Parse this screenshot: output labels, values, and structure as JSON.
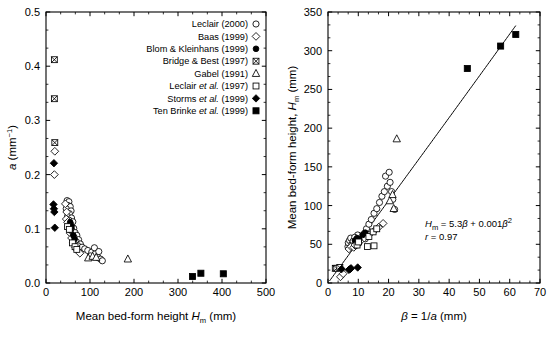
{
  "figure": {
    "background": "#ffffff",
    "ink": "#000000"
  },
  "legend": {
    "name": "data-source-legend",
    "entries": [
      {
        "label": "Leclair (2000)",
        "marker": "open-circle"
      },
      {
        "label": "Baas (1999)",
        "marker": "open-diamond"
      },
      {
        "label": "Blom & Kleinhans (1999)",
        "marker": "filled-circle"
      },
      {
        "label": "Bridge & Best (1997)",
        "marker": "crossed-square"
      },
      {
        "label": "Gabel (1991)",
        "marker": "open-triangle"
      },
      {
        "label": "Leclair et al. (1997)",
        "marker": "open-square"
      },
      {
        "label": "Storms et al. (1999)",
        "marker": "filled-diamond"
      },
      {
        "label": "Ten Brinke et al. (1999)",
        "marker": "filled-square"
      }
    ]
  },
  "chart_data": [
    {
      "id": "left-panel",
      "type": "scatter",
      "title": "",
      "xlabel": "Mean bed-form height Hₘ (mm)",
      "xlabel_parts": {
        "pre": "Mean bed-form height ",
        "sym": "H",
        "sub": "m",
        "post": " (mm)"
      },
      "ylabel": "a (mm⁻¹)",
      "ylabel_parts": {
        "sym": "a",
        "post": " (mm",
        "sup": "−1",
        "tail": ")"
      },
      "xlim": [
        0,
        500
      ],
      "ylim": [
        0.0,
        0.5
      ],
      "xticks": [
        0,
        100,
        200,
        300,
        400,
        500
      ],
      "xticklabels": [
        "0",
        "100",
        "200",
        "300",
        "400",
        "500"
      ],
      "yticks": [
        0.0,
        0.1,
        0.2,
        0.3,
        0.4,
        0.5
      ],
      "yticklabels": [
        "0.0",
        "0.1",
        "0.2",
        "0.3",
        "0.4",
        "0.5"
      ],
      "x_minor_count": 2,
      "y_minor_count": 2,
      "grid": false,
      "legend_position": "top-right-inside",
      "series": [
        {
          "name": "Leclair (2000)",
          "marker": "open-circle",
          "points": [
            [
              48,
              0.152
            ],
            [
              52,
              0.15
            ],
            [
              50,
              0.143
            ],
            [
              55,
              0.141
            ],
            [
              46,
              0.137
            ],
            [
              57,
              0.133
            ],
            [
              53,
              0.128
            ],
            [
              49,
              0.123
            ],
            [
              58,
              0.12
            ],
            [
              52,
              0.116
            ],
            [
              61,
              0.113
            ],
            [
              56,
              0.108
            ],
            [
              50,
              0.104
            ],
            [
              63,
              0.101
            ],
            [
              59,
              0.097
            ],
            [
              66,
              0.093
            ],
            [
              70,
              0.088
            ],
            [
              64,
              0.084
            ],
            [
              74,
              0.08
            ],
            [
              69,
              0.076
            ],
            [
              78,
              0.072
            ],
            [
              72,
              0.069
            ],
            [
              82,
              0.066
            ],
            [
              88,
              0.063
            ],
            [
              95,
              0.06
            ],
            [
              104,
              0.057
            ],
            [
              112,
              0.054
            ],
            [
              101,
              0.05
            ],
            [
              118,
              0.047
            ],
            [
              124,
              0.044
            ],
            [
              128,
              0.041
            ],
            [
              110,
              0.065
            ],
            [
              120,
              0.058
            ]
          ]
        },
        {
          "name": "Baas (1999)",
          "marker": "open-diamond",
          "points": [
            [
              20,
              0.243
            ],
            [
              19,
              0.2
            ],
            [
              44,
              0.146
            ],
            [
              47,
              0.131
            ],
            [
              46,
              0.118
            ],
            [
              49,
              0.112
            ],
            [
              52,
              0.1
            ],
            [
              55,
              0.092
            ],
            [
              58,
              0.083
            ],
            [
              62,
              0.074
            ],
            [
              67,
              0.066
            ],
            [
              72,
              0.06
            ],
            [
              77,
              0.055
            ]
          ]
        },
        {
          "name": "Blom & Kleinhans (1999)",
          "marker": "filled-circle",
          "points": [
            [
              55,
              0.112
            ],
            [
              58,
              0.104
            ],
            [
              56,
              0.097
            ],
            [
              62,
              0.088
            ],
            [
              65,
              0.081
            ]
          ]
        },
        {
          "name": "Bridge & Best (1997)",
          "marker": "crossed-square",
          "points": [
            [
              19,
              0.412
            ],
            [
              19,
              0.34
            ],
            [
              20,
              0.259
            ]
          ]
        },
        {
          "name": "Gabel (1991)",
          "marker": "open-triangle",
          "points": [
            [
              96,
              0.046
            ],
            [
              106,
              0.049
            ],
            [
              114,
              0.047
            ],
            [
              186,
              0.044
            ]
          ]
        },
        {
          "name": "Leclair et al. (1997)",
          "marker": "open-square",
          "points": [
            [
              49,
              0.104
            ],
            [
              53,
              0.099
            ],
            [
              60,
              0.074
            ],
            [
              66,
              0.067
            ],
            [
              70,
              0.062
            ]
          ]
        },
        {
          "name": "Storms et al. (1999)",
          "marker": "filled-diamond",
          "points": [
            [
              18,
              0.221
            ],
            [
              17,
              0.145
            ],
            [
              18,
              0.137
            ],
            [
              20,
              0.102
            ],
            [
              19,
              0.131
            ]
          ]
        },
        {
          "name": "Ten Brinke et al. (1999)",
          "marker": "filled-square",
          "points": [
            [
              333,
              0.012
            ],
            [
              352,
              0.018
            ],
            [
              403,
              0.017
            ]
          ]
        }
      ]
    },
    {
      "id": "right-panel",
      "type": "scatter",
      "title": "",
      "xlabel": "β = 1/a (mm)",
      "xlabel_parts": {
        "sym": "β",
        "mid": " = 1/",
        "sym2": "a",
        "post": " (mm)"
      },
      "ylabel": "Mean bed-form height, Hₘ (mm)",
      "ylabel_parts": {
        "pre": "Mean bed-form height, ",
        "sym": "H",
        "sub": "m",
        "post": " (mm)"
      },
      "xlim": [
        0,
        70
      ],
      "ylim": [
        0,
        350
      ],
      "xticks": [
        0,
        10,
        20,
        30,
        40,
        50,
        60,
        70
      ],
      "xticklabels": [
        "0",
        "10",
        "20",
        "30",
        "40",
        "50",
        "60",
        "70"
      ],
      "yticks": [
        0,
        50,
        100,
        150,
        200,
        250,
        300,
        350
      ],
      "yticklabels": [
        "0",
        "50",
        "100",
        "150",
        "200",
        "250",
        "300",
        "350"
      ],
      "x_minor_count": 2,
      "y_minor_count": 2,
      "grid": false,
      "annotation": {
        "equation": "Hₘ = 5.3β + 0.001β²",
        "equation_parts": {
          "sym": "H",
          "sub": "m",
          "mid": " = 5.3",
          "beta1": "β",
          "plus": " + 0.001",
          "beta2": "β",
          "sup": "2"
        },
        "correlation": "r = 0.97",
        "correlation_parts": {
          "sym": "r",
          "val": " = 0.97"
        }
      },
      "fit_line": {
        "description": "regression curve H_m = 5.3*beta + 0.001*beta^2",
        "coef_linear": 5.3,
        "coef_quadratic": 0.001,
        "x_start": 0.5,
        "x_end": 62
      },
      "series": [
        {
          "name": "Leclair (2000)",
          "marker": "open-circle",
          "points": [
            [
              6.6,
              47
            ],
            [
              6.7,
              52
            ],
            [
              7.1,
              55
            ],
            [
              7.5,
              58
            ],
            [
              7.9,
              50
            ],
            [
              8.3,
              54
            ],
            [
              8.6,
              47
            ],
            [
              9.0,
              52
            ],
            [
              9.4,
              57
            ],
            [
              9.6,
              49
            ],
            [
              10.2,
              52
            ],
            [
              10.7,
              56
            ],
            [
              11.3,
              60
            ],
            [
              12.0,
              64
            ],
            [
              12.7,
              70
            ],
            [
              13.5,
              76
            ],
            [
              14.3,
              82
            ],
            [
              15.2,
              90
            ],
            [
              16.1,
              96
            ],
            [
              17.0,
              104
            ],
            [
              17.8,
              112
            ],
            [
              18.6,
              118
            ],
            [
              19.6,
              125
            ],
            [
              20.5,
              130
            ],
            [
              21.4,
              108
            ],
            [
              22.0,
              95
            ],
            [
              19.0,
              138
            ],
            [
              20.2,
              143
            ],
            [
              21.0,
              118
            ],
            [
              9.8,
              62
            ],
            [
              8.8,
              59
            ],
            [
              12.3,
              57
            ]
          ]
        },
        {
          "name": "Baas (1999)",
          "marker": "open-diamond",
          "points": [
            [
              4.1,
              8
            ],
            [
              5.0,
              12
            ],
            [
              6.9,
              44
            ],
            [
              7.6,
              47
            ],
            [
              8.5,
              46
            ],
            [
              8.9,
              49
            ],
            [
              10.0,
              52
            ],
            [
              10.9,
              55
            ],
            [
              12.0,
              58
            ],
            [
              13.5,
              62
            ],
            [
              15.2,
              67
            ],
            [
              16.7,
              72
            ],
            [
              18.2,
              77
            ]
          ]
        },
        {
          "name": "Blom & Kleinhans (1999)",
          "marker": "filled-circle",
          "points": [
            [
              8.9,
              55
            ],
            [
              9.6,
              58
            ],
            [
              10.3,
              56
            ],
            [
              11.4,
              62
            ],
            [
              12.3,
              65
            ]
          ]
        },
        {
          "name": "Bridge & Best (1997)",
          "marker": "crossed-square",
          "points": [
            [
              2.4,
              19
            ],
            [
              2.9,
              19
            ],
            [
              3.9,
              20
            ]
          ]
        },
        {
          "name": "Gabel (1991)",
          "marker": "open-triangle",
          "points": [
            [
              21.7,
              96
            ],
            [
              20.4,
              106
            ],
            [
              21.3,
              114
            ],
            [
              22.7,
              186
            ]
          ]
        },
        {
          "name": "Leclair et al. (1997)",
          "marker": "open-square",
          "points": [
            [
              9.6,
              49
            ],
            [
              10.1,
              53
            ],
            [
              13.5,
              60
            ],
            [
              14.9,
              66
            ],
            [
              16.1,
              70
            ],
            [
              15.2,
              48
            ],
            [
              13.0,
              47
            ]
          ]
        },
        {
          "name": "Storms et al. (1999)",
          "marker": "filled-diamond",
          "points": [
            [
              4.5,
              18
            ],
            [
              6.9,
              17
            ],
            [
              7.3,
              18
            ],
            [
              9.8,
              20
            ],
            [
              7.6,
              19
            ]
          ]
        },
        {
          "name": "Ten Brinke et al. (1999)",
          "marker": "filled-square",
          "points": [
            [
              46,
              277
            ],
            [
              57,
              306
            ],
            [
              62,
              321
            ]
          ]
        }
      ]
    }
  ]
}
